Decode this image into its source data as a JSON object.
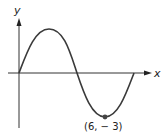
{
  "diagram": {
    "type": "sinusoid-graph",
    "axes": {
      "x_label": "x",
      "y_label": "y"
    },
    "curve": {
      "description": "one full period of a sine wave starting at origin, max then min",
      "color": "#3a3a3a"
    },
    "point": {
      "label": "(6, − 3)",
      "x": 6,
      "y": -3,
      "color": "#444444"
    }
  }
}
